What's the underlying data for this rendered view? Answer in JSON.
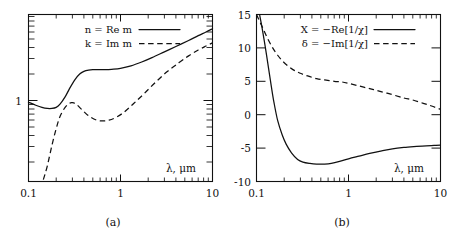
{
  "figure": {
    "panels": [
      {
        "id": "a",
        "caption": "(a)",
        "xlabel": "λ, μm",
        "legend": [
          {
            "label": "n = Re m",
            "style": "solid"
          },
          {
            "label": "k = Im m",
            "style": "dashed"
          }
        ],
        "xticklabels": [
          "0.1",
          "1",
          "10"
        ],
        "yticklabels": [
          "1"
        ]
      },
      {
        "id": "b",
        "caption": "(b)",
        "xlabel": "λ, μm",
        "legend": [
          {
            "label": "X = −Re[1/χ]",
            "style": "solid"
          },
          {
            "label": "δ = −Im[1/χ]",
            "style": "dashed"
          }
        ],
        "xticklabels": [
          "0.1",
          "1",
          "10"
        ],
        "yticklabels": [
          "15",
          "10",
          "5",
          "0",
          "-5",
          "-10"
        ]
      }
    ]
  },
  "chart_data": [
    {
      "type": "line",
      "panel": "a",
      "title": "",
      "xlabel": "λ, μm",
      "ylabel": "",
      "xscale": "log",
      "yscale": "log",
      "xlim": [
        0.1,
        10
      ],
      "ylim": [
        0.1,
        8
      ],
      "xticks": [
        0.1,
        1,
        10
      ],
      "xticklabels": [
        "0.1",
        "1",
        "10"
      ],
      "yticks": [
        1
      ],
      "yticklabels": [
        "1"
      ],
      "grid": false,
      "legend_position": "upper-left",
      "series": [
        {
          "name": "n = Re m",
          "style": "solid",
          "x": [
            0.1,
            0.12,
            0.14,
            0.16,
            0.18,
            0.2,
            0.22,
            0.25,
            0.28,
            0.32,
            0.36,
            0.4,
            0.45,
            0.5,
            0.6,
            0.7,
            0.8,
            1.0,
            1.3,
            1.7,
            2.2,
            3.0,
            4.0,
            5.5,
            7.0,
            8.5,
            10.0
          ],
          "y": [
            0.8,
            0.74,
            0.7,
            0.68,
            0.68,
            0.7,
            0.76,
            0.92,
            1.15,
            1.45,
            1.68,
            1.8,
            1.86,
            1.88,
            1.88,
            1.88,
            1.9,
            1.95,
            2.08,
            2.3,
            2.58,
            3.0,
            3.45,
            4.05,
            4.6,
            5.05,
            5.5
          ]
        },
        {
          "name": "k = Im m",
          "style": "dashed",
          "x": [
            0.145,
            0.16,
            0.18,
            0.2,
            0.22,
            0.25,
            0.28,
            0.3,
            0.33,
            0.38,
            0.45,
            0.55,
            0.65,
            0.75,
            0.9,
            1.1,
            1.4,
            1.8,
            2.4,
            3.2,
            4.3,
            5.5,
            7.0,
            8.5,
            10.0
          ],
          "y": [
            0.105,
            0.15,
            0.26,
            0.4,
            0.55,
            0.7,
            0.78,
            0.79,
            0.76,
            0.66,
            0.56,
            0.5,
            0.49,
            0.5,
            0.54,
            0.62,
            0.78,
            1.0,
            1.35,
            1.78,
            2.25,
            2.7,
            3.15,
            3.5,
            3.8
          ]
        }
      ]
    },
    {
      "type": "line",
      "panel": "b",
      "title": "",
      "xlabel": "λ, μm",
      "ylabel": "",
      "xscale": "log",
      "yscale": "linear",
      "xlim": [
        0.1,
        10
      ],
      "ylim": [
        -10,
        15
      ],
      "xticks": [
        0.1,
        1,
        10
      ],
      "xticklabels": [
        "0.1",
        "1",
        "10"
      ],
      "yticks": [
        15,
        10,
        5,
        0,
        -5,
        -10
      ],
      "yticklabels": [
        "15",
        "10",
        "5",
        "0",
        "-5",
        "-10"
      ],
      "grid": false,
      "legend_position": "upper-center",
      "series": [
        {
          "name": "X = −Re[1/χ]",
          "style": "solid",
          "x": [
            0.108,
            0.115,
            0.125,
            0.135,
            0.145,
            0.155,
            0.17,
            0.19,
            0.21,
            0.24,
            0.28,
            0.32,
            0.38,
            0.45,
            0.55,
            0.65,
            0.8,
            1.0,
            1.3,
            1.7,
            2.3,
            3.0,
            4.0,
            5.5,
            7.0,
            8.5,
            10.0
          ],
          "y": [
            15.0,
            13.0,
            10.0,
            7.0,
            4.2,
            1.8,
            -0.9,
            -3.0,
            -4.4,
            -5.7,
            -6.7,
            -7.1,
            -7.3,
            -7.4,
            -7.4,
            -7.3,
            -7.0,
            -6.6,
            -6.2,
            -5.8,
            -5.4,
            -5.1,
            -4.9,
            -4.75,
            -4.65,
            -4.6,
            -4.55
          ]
        },
        {
          "name": "δ = −Im[1/χ]",
          "style": "dashed",
          "x": [
            0.1,
            0.115,
            0.13,
            0.15,
            0.17,
            0.19,
            0.22,
            0.26,
            0.3,
            0.36,
            0.45,
            0.55,
            0.7,
            0.85,
            1.0,
            1.3,
            1.7,
            2.2,
            3.0,
            4.0,
            5.0,
            6.5,
            8.0,
            10.0
          ],
          "y": [
            15.0,
            13.2,
            11.6,
            10.0,
            8.9,
            8.1,
            7.3,
            6.6,
            6.2,
            5.8,
            5.4,
            5.2,
            5.0,
            4.9,
            4.7,
            4.3,
            3.9,
            3.5,
            3.0,
            2.5,
            2.2,
            1.7,
            1.3,
            0.8
          ]
        }
      ]
    }
  ]
}
